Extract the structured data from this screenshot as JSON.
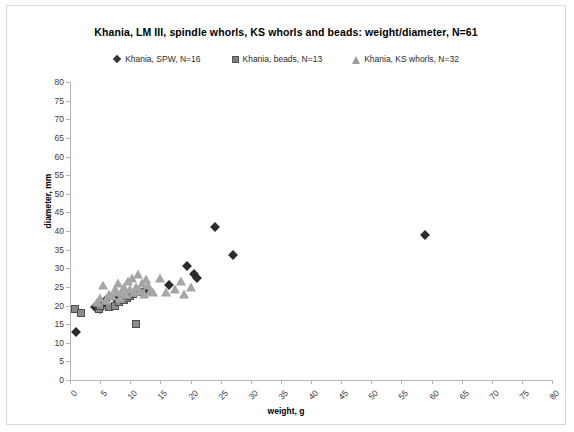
{
  "chart_data": {
    "type": "scatter",
    "title": "Khania, LM III, spindle whorls, KS whorls and beads: weight/diameter, N=61",
    "xlabel": "weight, g",
    "ylabel": "diameter, mm",
    "xlim": [
      0,
      80
    ],
    "ylim": [
      0,
      80
    ],
    "xticks": [
      0,
      5,
      10,
      15,
      20,
      25,
      30,
      35,
      40,
      45,
      50,
      55,
      60,
      65,
      70,
      75,
      80
    ],
    "yticks": [
      0,
      5,
      10,
      15,
      20,
      25,
      30,
      35,
      40,
      45,
      50,
      55,
      60,
      65,
      70,
      75,
      80
    ],
    "grid": false,
    "legend_position": "top-center",
    "series": [
      {
        "name": "Khania, SPW, N=16",
        "marker": "diamond",
        "color": "#2b2b2b",
        "count": 16,
        "points": [
          [
            1.0,
            13.0
          ],
          [
            4.2,
            19.5
          ],
          [
            5.0,
            19.0
          ],
          [
            5.2,
            20.0
          ],
          [
            6.0,
            21.5
          ],
          [
            7.5,
            22.0
          ],
          [
            8.0,
            21.0
          ],
          [
            9.5,
            22.5
          ],
          [
            12.5,
            24.0
          ],
          [
            16.5,
            25.5
          ],
          [
            19.5,
            30.5
          ],
          [
            20.5,
            28.5
          ],
          [
            21.0,
            27.5
          ],
          [
            24.0,
            41.0
          ],
          [
            27.0,
            33.5
          ],
          [
            59.0,
            39.0
          ]
        ]
      },
      {
        "name": "Khania, beads, N=13",
        "marker": "square",
        "color": "#8c8c8c",
        "count": 13,
        "points": [
          [
            0.8,
            19.0
          ],
          [
            1.8,
            18.0
          ],
          [
            4.8,
            19.0
          ],
          [
            5.0,
            20.0
          ],
          [
            6.5,
            19.5
          ],
          [
            7.5,
            20.0
          ],
          [
            8.2,
            21.0
          ],
          [
            9.0,
            21.5
          ],
          [
            9.5,
            22.0
          ],
          [
            10.0,
            22.5
          ],
          [
            10.5,
            23.0
          ],
          [
            11.0,
            15.0
          ],
          [
            12.0,
            23.5
          ]
        ]
      },
      {
        "name": "Khania, KS whorls, N=32",
        "marker": "triangle",
        "color": "#a6a6a6",
        "count": 32,
        "points": [
          [
            4.5,
            21.0
          ],
          [
            5.0,
            22.0
          ],
          [
            5.5,
            25.5
          ],
          [
            6.0,
            21.5
          ],
          [
            6.5,
            23.0
          ],
          [
            7.0,
            22.5
          ],
          [
            7.5,
            24.5
          ],
          [
            7.8,
            23.5
          ],
          [
            8.0,
            26.0
          ],
          [
            8.3,
            22.0
          ],
          [
            8.6,
            24.0
          ],
          [
            9.0,
            25.0
          ],
          [
            9.3,
            23.0
          ],
          [
            9.6,
            26.5
          ],
          [
            10.0,
            24.5
          ],
          [
            10.3,
            27.5
          ],
          [
            10.6,
            23.5
          ],
          [
            11.0,
            25.0
          ],
          [
            11.3,
            28.5
          ],
          [
            11.6,
            24.0
          ],
          [
            12.0,
            26.0
          ],
          [
            12.3,
            23.0
          ],
          [
            12.6,
            27.0
          ],
          [
            13.0,
            25.5
          ],
          [
            13.3,
            24.0
          ],
          [
            13.8,
            23.5
          ],
          [
            15.0,
            27.5
          ],
          [
            16.0,
            23.5
          ],
          [
            17.5,
            24.5
          ],
          [
            18.5,
            26.5
          ],
          [
            19.0,
            23.0
          ],
          [
            20.0,
            25.0
          ]
        ]
      }
    ]
  }
}
